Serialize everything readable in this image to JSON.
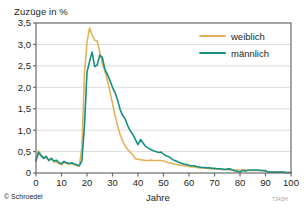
{
  "axis_titles": {
    "y": "Zuzüge in %",
    "x": "Jahre"
  },
  "footer": {
    "copyright": "© Schroedel",
    "figure_code": "7343H"
  },
  "legend": {
    "entries": [
      {
        "label": "weiblich",
        "color": "#e3b35c"
      },
      {
        "label": "männlich",
        "color": "#159184"
      }
    ]
  },
  "ticks": {
    "y": [
      "0",
      "0,5",
      "1,0",
      "1,5",
      "2,0",
      "2,5",
      "3,0",
      "3,5"
    ],
    "x": [
      "0",
      "10",
      "20",
      "30",
      "40",
      "50",
      "60",
      "70",
      "80",
      "90",
      "100"
    ]
  },
  "chart_data": {
    "type": "line",
    "title": "",
    "xlabel": "Jahre",
    "ylabel": "Zuzüge in %",
    "xlim": [
      0,
      100
    ],
    "ylim": [
      0,
      3.5
    ],
    "grid": "horizontal",
    "legend_position": "top-right",
    "x": [
      0,
      1,
      2,
      3,
      4,
      5,
      6,
      7,
      8,
      9,
      10,
      11,
      12,
      13,
      14,
      15,
      16,
      17,
      18,
      19,
      20,
      21,
      22,
      23,
      24,
      25,
      26,
      27,
      28,
      29,
      30,
      31,
      32,
      33,
      34,
      35,
      36,
      37,
      38,
      39,
      40,
      41,
      42,
      43,
      44,
      45,
      46,
      47,
      48,
      49,
      50,
      51,
      52,
      53,
      54,
      55,
      56,
      57,
      58,
      59,
      60,
      61,
      62,
      63,
      64,
      65,
      66,
      67,
      68,
      69,
      70,
      71,
      72,
      73,
      74,
      75,
      76,
      77,
      78,
      79,
      80,
      81,
      82,
      83,
      84,
      85,
      86,
      87,
      88,
      89,
      90,
      91,
      92,
      93,
      94,
      95,
      96,
      97,
      98,
      99,
      100
    ],
    "series": [
      {
        "name": "weiblich",
        "color": "#e3b35c",
        "values": [
          0.3,
          0.52,
          0.42,
          0.37,
          0.36,
          0.31,
          0.33,
          0.26,
          0.26,
          0.22,
          0.19,
          0.24,
          0.22,
          0.2,
          0.22,
          0.19,
          0.17,
          0.16,
          0.6,
          2.3,
          3.05,
          3.38,
          3.22,
          3.1,
          3.08,
          2.82,
          2.55,
          2.38,
          2.16,
          1.9,
          1.62,
          1.34,
          1.1,
          0.9,
          0.74,
          0.63,
          0.55,
          0.48,
          0.42,
          0.33,
          0.32,
          0.31,
          0.3,
          0.29,
          0.29,
          0.3,
          0.29,
          0.29,
          0.29,
          0.29,
          0.28,
          0.26,
          0.24,
          0.23,
          0.21,
          0.2,
          0.19,
          0.18,
          0.17,
          0.16,
          0.15,
          0.14,
          0.14,
          0.13,
          0.12,
          0.12,
          0.11,
          0.11,
          0.1,
          0.1,
          0.09,
          0.09,
          0.09,
          0.08,
          0.08,
          0.08,
          0.07,
          0.07,
          0.07,
          0.07,
          0.07,
          0.07,
          0.07,
          0.07,
          0.06,
          0.06,
          0.06,
          0.06,
          0.06,
          0.06,
          0.06,
          0.03,
          0.02,
          0.02,
          0.02,
          0.02,
          0.02,
          0.02,
          0.01,
          0.01,
          0.01
        ]
      },
      {
        "name": "männlich",
        "color": "#159184",
        "values": [
          0.28,
          0.48,
          0.4,
          0.34,
          0.39,
          0.29,
          0.34,
          0.28,
          0.3,
          0.24,
          0.22,
          0.27,
          0.24,
          0.22,
          0.24,
          0.21,
          0.19,
          0.17,
          0.28,
          1.1,
          2.35,
          2.6,
          2.82,
          2.48,
          2.52,
          2.75,
          2.7,
          2.42,
          2.3,
          2.16,
          2.0,
          1.88,
          1.7,
          1.48,
          1.34,
          1.26,
          1.1,
          0.98,
          0.9,
          0.78,
          0.66,
          0.78,
          0.7,
          0.62,
          0.58,
          0.55,
          0.52,
          0.5,
          0.48,
          0.49,
          0.44,
          0.4,
          0.38,
          0.34,
          0.3,
          0.28,
          0.25,
          0.23,
          0.21,
          0.2,
          0.18,
          0.17,
          0.17,
          0.15,
          0.14,
          0.13,
          0.13,
          0.12,
          0.12,
          0.11,
          0.11,
          0.1,
          0.1,
          0.09,
          0.08,
          0.09,
          0.1,
          0.07,
          0.05,
          0.04,
          0.02,
          0.06,
          0.05,
          0.06,
          0.07,
          0.07,
          0.07,
          0.07,
          0.06,
          0.06,
          0.05,
          0.02,
          0.02,
          0.02,
          0.02,
          0.02,
          0.02,
          0.02,
          0.01,
          0.01,
          0.01
        ]
      }
    ]
  },
  "plot_geometry": {
    "left": 36,
    "right": 291,
    "top": 23,
    "bottom": 173
  },
  "colors": {
    "frame": "#6b6b6b",
    "grid": "#dcdcdc",
    "text": "#231f20"
  }
}
